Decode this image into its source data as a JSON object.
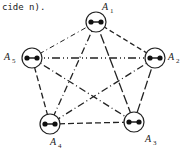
{
  "caption": "cide n).",
  "diagram": {
    "type": "complete-graph",
    "nodes": [
      {
        "id": "A1",
        "letter": "A",
        "sub": "1",
        "x": 96,
        "y": 22
      },
      {
        "id": "A2",
        "letter": "A",
        "sub": "2",
        "x": 155,
        "y": 58
      },
      {
        "id": "A3",
        "letter": "A",
        "sub": "3",
        "x": 134,
        "y": 122
      },
      {
        "id": "A4",
        "letter": "A",
        "sub": "4",
        "x": 50,
        "y": 124
      },
      {
        "id": "A5",
        "letter": "A",
        "sub": "5",
        "x": 32,
        "y": 58
      }
    ],
    "edges": [
      {
        "from": "A1",
        "to": "A2",
        "style": "dashed"
      },
      {
        "from": "A1",
        "to": "A5",
        "style": "dash-dot"
      },
      {
        "from": "A1",
        "to": "A3",
        "style": "long-dash"
      },
      {
        "from": "A1",
        "to": "A4",
        "style": "dash-dot"
      },
      {
        "from": "A2",
        "to": "A5",
        "style": "dash-dot-dot"
      },
      {
        "from": "A2",
        "to": "A3",
        "style": "long-dash"
      },
      {
        "from": "A2",
        "to": "A4",
        "style": "dash-dot"
      },
      {
        "from": "A5",
        "to": "A4",
        "style": "dashed"
      },
      {
        "from": "A5",
        "to": "A3",
        "style": "dash-dot"
      },
      {
        "from": "A4",
        "to": "A3",
        "style": "dashed"
      }
    ]
  }
}
